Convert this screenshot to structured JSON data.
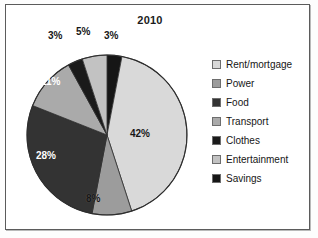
{
  "chart_data": {
    "type": "pie",
    "title": "2010",
    "xlabel": "",
    "ylabel": "",
    "legend_position": "right",
    "grid": false,
    "unit": "%",
    "categories": [
      "Rent/mortgage",
      "Power",
      "Food",
      "Transport",
      "Clothes",
      "Entertainment",
      "Savings"
    ],
    "values": [
      42,
      8,
      28,
      11,
      3,
      5,
      3
    ],
    "labels": [
      "42%",
      "8%",
      "28%",
      "11%",
      "3%",
      "5%",
      "3%"
    ],
    "colors": [
      "#d9d9d9",
      "#9c9c9c",
      "#333333",
      "#aaaaaa",
      "#1a1a1a",
      "#c2c2c2",
      "#161616"
    ],
    "slice_order_clockwise_from_top": [
      "Savings",
      "Rent/mortgage",
      "Power",
      "Food",
      "Transport",
      "Clothes",
      "Entertainment"
    ],
    "slices": [
      {
        "name": "Savings",
        "value": 3,
        "label": "3%",
        "color": "#161616",
        "label_color": "dark",
        "label_placement": "outside"
      },
      {
        "name": "Rent/mortgage",
        "value": 42,
        "label": "42%",
        "color": "#d9d9d9",
        "label_color": "dark",
        "label_placement": "inside"
      },
      {
        "name": "Power",
        "value": 8,
        "label": "8%",
        "color": "#9c9c9c",
        "label_color": "dark",
        "label_placement": "inside"
      },
      {
        "name": "Food",
        "value": 28,
        "label": "28%",
        "color": "#333333",
        "label_color": "light",
        "label_placement": "inside"
      },
      {
        "name": "Transport",
        "value": 11,
        "label": "11%",
        "color": "#aaaaaa",
        "label_color": "light",
        "label_placement": "inside"
      },
      {
        "name": "Clothes",
        "value": 3,
        "label": "3%",
        "color": "#1a1a1a",
        "label_color": "dark",
        "label_placement": "outside"
      },
      {
        "name": "Entertainment",
        "value": 5,
        "label": "5%",
        "color": "#c2c2c2",
        "label_color": "dark",
        "label_placement": "outside"
      }
    ]
  },
  "legend": {
    "items": [
      {
        "label": "Rent/mortgage",
        "color": "#d9d9d9"
      },
      {
        "label": "Power",
        "color": "#9c9c9c"
      },
      {
        "label": "Food",
        "color": "#333333"
      },
      {
        "label": "Transport",
        "color": "#aaaaaa"
      },
      {
        "label": "Clothes",
        "color": "#1a1a1a"
      },
      {
        "label": "Entertainment",
        "color": "#c2c2c2"
      },
      {
        "label": "Savings",
        "color": "#161616"
      }
    ]
  },
  "labels": {
    "top_left_outside": "3%",
    "top_middle_outside": "5%",
    "top_right_outside": "3%",
    "rent": "42%",
    "power": "8%",
    "food": "28%",
    "transport": "11%"
  }
}
